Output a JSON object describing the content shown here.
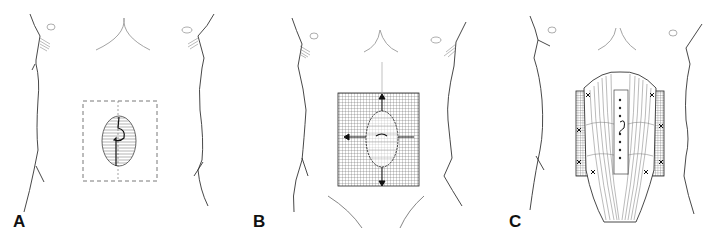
{
  "figure": {
    "panels": [
      {
        "id": "A",
        "label": "A",
        "description": "Abdominal wall defect outlined with dashed excision boundary"
      },
      {
        "id": "B",
        "label": "B",
        "description": "Mesh grid placed over defect with tension arrows"
      },
      {
        "id": "C",
        "label": "C",
        "description": "Rectus muscles approximated in midline with sutures over mesh"
      }
    ],
    "colors": {
      "line": "#222222",
      "light_line": "#888888",
      "background": "#ffffff"
    }
  }
}
